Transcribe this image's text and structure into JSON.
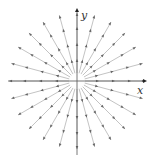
{
  "diagram": {
    "title": "",
    "type": "radial vector field (source at origin)",
    "axes": {
      "x_label": "x",
      "y_label": "y",
      "origin": [
        77,
        81
      ],
      "x_range_px": [
        8,
        145
      ],
      "y_range_px": [
        10,
        155
      ],
      "color": "#555555"
    },
    "field": {
      "description": "Vectors pointing radially outward from the origin",
      "angles_deg": [
        0,
        15,
        30,
        45,
        60,
        75,
        90,
        105,
        120,
        135,
        150,
        165,
        180,
        195,
        210,
        225,
        240,
        255,
        270,
        285,
        300,
        315,
        330,
        345
      ],
      "inner_radius": 8,
      "outer_radius": 68,
      "arrow_positions": [
        22,
        38,
        54
      ],
      "line_color": "#9a9a9a",
      "arrow_color": "#666666"
    }
  }
}
